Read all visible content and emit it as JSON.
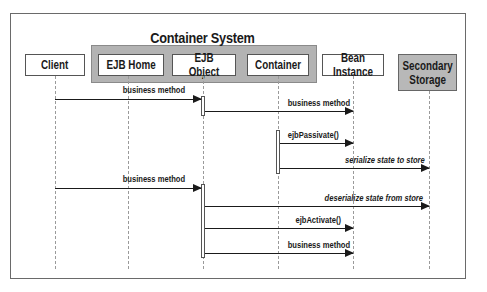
{
  "diagram": {
    "type": "sequence",
    "title": "Container System",
    "participants": [
      {
        "id": "client",
        "label": "Client"
      },
      {
        "id": "ejb_home",
        "label": "EJB Home"
      },
      {
        "id": "ejb_object",
        "label": "EJB Object"
      },
      {
        "id": "container",
        "label": "Container"
      },
      {
        "id": "bean_instance",
        "label": "Bean Instance"
      },
      {
        "id": "secondary_storage",
        "label": "Secondary\nStorage"
      }
    ],
    "messages": [
      {
        "from": "client",
        "to": "ejb_object",
        "label": "business method"
      },
      {
        "from": "ejb_object",
        "to": "bean_instance",
        "label": "business method"
      },
      {
        "from": "container",
        "to": "bean_instance",
        "label": "ejbPassivate()"
      },
      {
        "from": "container",
        "to": "secondary_storage",
        "label": "serialize state to store"
      },
      {
        "from": "client",
        "to": "ejb_object",
        "label": "business method"
      },
      {
        "from": "ejb_object",
        "to": "secondary_storage",
        "label": "deserialize state from store"
      },
      {
        "from": "ejb_object",
        "to": "bean_instance",
        "label": "ejbActivate()"
      },
      {
        "from": "ejb_object",
        "to": "bean_instance",
        "label": "business method"
      }
    ]
  }
}
